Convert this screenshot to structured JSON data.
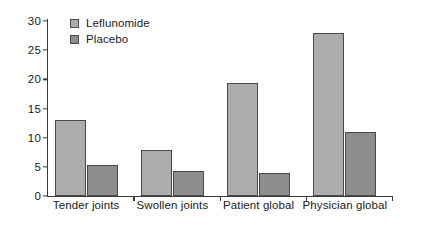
{
  "chart_data": {
    "type": "bar",
    "title": "",
    "xlabel": "",
    "ylabel": "",
    "categories": [
      "Tender joints",
      "Swollen joints",
      "Patient global",
      "Physician global"
    ],
    "series": [
      {
        "name": "Leflunomide",
        "color": "#adadad",
        "values": [
          13.1,
          7.9,
          19.3,
          27.9
        ]
      },
      {
        "name": "Placebo",
        "color": "#8d8d8d",
        "values": [
          5.4,
          4.3,
          3.9,
          10.9
        ]
      }
    ],
    "ylim": [
      0,
      30
    ],
    "yticks": [
      0,
      5,
      10,
      15,
      20,
      25,
      30
    ],
    "ytick_labels": [
      "0",
      "5",
      "10",
      "15",
      "20",
      "25",
      "30"
    ],
    "grid": false,
    "legend_position": "top-left"
  },
  "legend": {
    "items": [
      {
        "label": "Leflunomide"
      },
      {
        "label": "Placebo"
      }
    ]
  },
  "axis": {
    "line_color": "#3b3b3b"
  }
}
